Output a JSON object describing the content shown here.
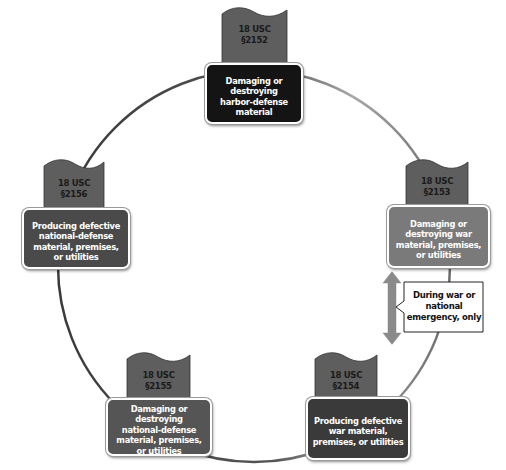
{
  "diagram": {
    "colors": {
      "circle_dark": "#3a3a3a",
      "circle_light": "#a8a8a8",
      "flag_fill": "#5e5e5e",
      "box_top": "#141414",
      "box_right": "#7a7a7a",
      "box_left": "#4a4a4a",
      "box_bottom_left": "#555555",
      "box_bottom_right": "#3a3a3a",
      "arrow_fill": "#8a8a8a",
      "callout_fill": "#ffffff"
    },
    "nodes": [
      {
        "id": "top",
        "code_line1": "18 USC",
        "code_line2": "§2152",
        "label": "Damaging or\ndestroying\nharbor-defense\nmaterial"
      },
      {
        "id": "right",
        "code_line1": "18 USC",
        "code_line2": "§2153",
        "label": "Damaging or\ndestroying war\nmaterial, premises,\nor utilities"
      },
      {
        "id": "bottom_right",
        "code_line1": "18 USC",
        "code_line2": "§2154",
        "label": "Producing defective\nwar material,\npremises, or utilities"
      },
      {
        "id": "bottom_left",
        "code_line1": "18 USC",
        "code_line2": "§2155",
        "label": "Damaging or destroying\nnational-defense\nmaterial, premises,\nor utilities"
      },
      {
        "id": "left",
        "code_line1": "18 USC",
        "code_line2": "§2156",
        "label": "Producing defective\nnational-defense\nmaterial, premises,\nor utilities"
      }
    ],
    "callout": {
      "label": "During war or\nnational\nemergency, only"
    }
  }
}
